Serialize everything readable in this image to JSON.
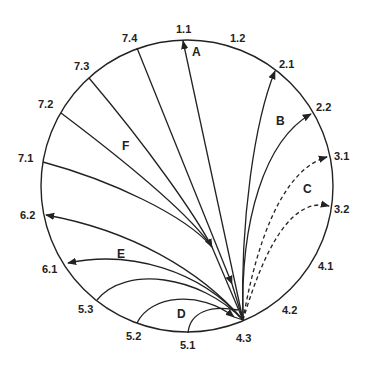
{
  "diagram": {
    "type": "circular-transition-diagram",
    "colors": {
      "stroke": "#222222",
      "background": "#ffffff"
    },
    "circle": {
      "cx": 187,
      "cy": 186,
      "r": 146
    },
    "hub": {
      "id": "4.3",
      "x": 243,
      "y": 320
    },
    "points": [
      {
        "id": "1.1",
        "label": "1.1",
        "x": 183,
        "y": 40,
        "lx": 176,
        "ly": 33
      },
      {
        "id": "1.2",
        "label": "1.2",
        "x": 230,
        "y": 46,
        "lx": 230,
        "ly": 42
      },
      {
        "id": "2.1",
        "label": "2.1",
        "x": 275,
        "y": 70,
        "lx": 279,
        "ly": 68
      },
      {
        "id": "2.2",
        "label": "2.2",
        "x": 312,
        "y": 113,
        "lx": 316,
        "ly": 111
      },
      {
        "id": "3.1",
        "label": "3.1",
        "x": 328,
        "y": 157,
        "lx": 334,
        "ly": 160
      },
      {
        "id": "3.2",
        "label": "3.2",
        "x": 330,
        "y": 205,
        "lx": 334,
        "ly": 213
      },
      {
        "id": "4.1",
        "label": "4.1",
        "x": 320,
        "y": 262,
        "lx": 318,
        "ly": 270
      },
      {
        "id": "4.2",
        "label": "4.2",
        "x": 290,
        "y": 300,
        "lx": 282,
        "ly": 314
      },
      {
        "id": "4.3",
        "label": "4.3",
        "x": 243,
        "y": 320,
        "lx": 236,
        "ly": 342
      },
      {
        "id": "5.1",
        "label": "5.1",
        "x": 188,
        "y": 333,
        "lx": 180,
        "ly": 349
      },
      {
        "id": "5.2",
        "label": "5.2",
        "x": 137,
        "y": 323,
        "lx": 126,
        "ly": 340
      },
      {
        "id": "5.3",
        "label": "5.3",
        "x": 97,
        "y": 300,
        "lx": 78,
        "ly": 313
      },
      {
        "id": "6.1",
        "label": "6.1",
        "x": 67,
        "y": 263,
        "lx": 42,
        "ly": 273
      },
      {
        "id": "6.2",
        "label": "6.2",
        "x": 45,
        "y": 215,
        "lx": 20,
        "ly": 219
      },
      {
        "id": "7.1",
        "label": "7.1",
        "x": 43,
        "y": 162,
        "lx": 18,
        "ly": 162
      },
      {
        "id": "7.2",
        "label": "7.2",
        "x": 61,
        "y": 113,
        "lx": 38,
        "ly": 108
      },
      {
        "id": "7.3",
        "label": "7.3",
        "x": 89,
        "y": 78,
        "lx": 74,
        "ly": 70
      },
      {
        "id": "7.4",
        "label": "7.4",
        "x": 137,
        "y": 48,
        "lx": 122,
        "ly": 42
      }
    ],
    "groups": [
      {
        "id": "A",
        "label": "A",
        "lx": 192,
        "ly": 56,
        "style": "solid",
        "description": "4.3 → 1.1"
      },
      {
        "id": "B",
        "label": "B",
        "lx": 276,
        "ly": 125,
        "style": "solid",
        "description": "4.3 → 2.1, 2.2"
      },
      {
        "id": "C",
        "label": "C",
        "lx": 303,
        "ly": 193,
        "style": "dashed",
        "description": "4.3 → 3.1, 3.2"
      },
      {
        "id": "D",
        "label": "D",
        "lx": 177,
        "ly": 318,
        "style": "solid",
        "description": "5.1, 5.2, 5.3 → 4.3"
      },
      {
        "id": "E",
        "label": "E",
        "lx": 117,
        "ly": 258,
        "style": "solid",
        "description": "4.3 → 6.1, 6.2"
      },
      {
        "id": "F",
        "label": "F",
        "lx": 122,
        "ly": 150,
        "style": "solid",
        "description": "7.1, 7.2, 7.3, 7.4 → 4.3"
      }
    ]
  }
}
